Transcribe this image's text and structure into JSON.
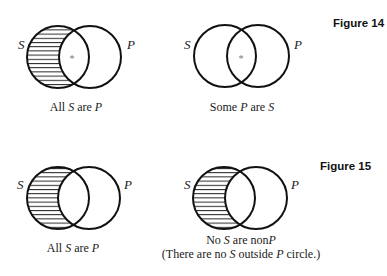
{
  "figures": [
    {
      "label": "Figure 14",
      "diagrams": [
        {
          "left_label": "S",
          "right_label": "P",
          "shaded_region": "S outside P",
          "marker": "*",
          "caption": "All S are P",
          "caption_parts": [
            "All ",
            "S",
            " are ",
            "P"
          ]
        },
        {
          "left_label": "S",
          "right_label": "P",
          "shaded_region": "none",
          "marker": "*",
          "caption": "Some P are S",
          "caption_parts": [
            "Some ",
            "P",
            " are ",
            "S"
          ]
        }
      ]
    },
    {
      "label": "Figure 15",
      "diagrams": [
        {
          "left_label": "S",
          "right_label": "P",
          "shaded_region": "S outside P",
          "marker": "",
          "caption": "All S are P",
          "caption_parts": [
            "All ",
            "S",
            " are ",
            "P"
          ]
        },
        {
          "left_label": "S",
          "right_label": "P",
          "shaded_region": "S outside P",
          "marker": "",
          "caption": "No S are nonP",
          "caption_parts": [
            "No ",
            "S",
            " are non",
            "P"
          ],
          "subcaption": "(There are no S outside P circle.)",
          "subcaption_parts": [
            "(There are no ",
            "S",
            " outside ",
            "P",
            " circle.)"
          ]
        }
      ]
    }
  ],
  "colors": {
    "stroke": "#111111",
    "hatch": "#222222",
    "background": "#ffffff"
  }
}
